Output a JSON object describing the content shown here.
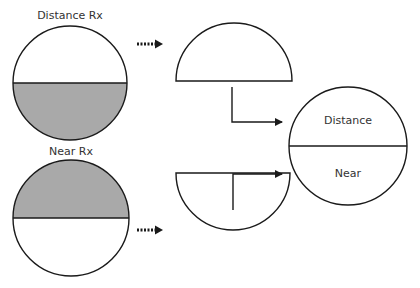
{
  "diagram": {
    "labels": {
      "distance_rx": "Distance Rx",
      "near_rx": "Near Rx",
      "result_distance": "Distance",
      "result_near": "Near"
    },
    "colors": {
      "stroke": "#1a1a1a",
      "shaded": "#a9a9a9",
      "background": "#ffffff",
      "text": "#333333"
    },
    "nodes": [
      {
        "id": "distance-rx-lens",
        "label": "Distance Rx",
        "shaded_half": "bottom"
      },
      {
        "id": "near-rx-lens",
        "label": "Near Rx",
        "shaded_half": "top"
      },
      {
        "id": "top-half-segment",
        "label": ""
      },
      {
        "id": "bottom-half-segment",
        "label": ""
      },
      {
        "id": "combined-lens",
        "label": "Distance / Near"
      }
    ],
    "edges": [
      {
        "from": "distance-rx-lens",
        "to": "top-half-segment",
        "style": "dashed-arrow"
      },
      {
        "from": "near-rx-lens",
        "to": "bottom-half-segment",
        "style": "dashed-arrow"
      },
      {
        "from": "top-half-segment",
        "to": "combined-lens",
        "style": "elbow-arrow"
      },
      {
        "from": "bottom-half-segment",
        "to": "combined-lens",
        "style": "elbow-arrow"
      }
    ]
  }
}
